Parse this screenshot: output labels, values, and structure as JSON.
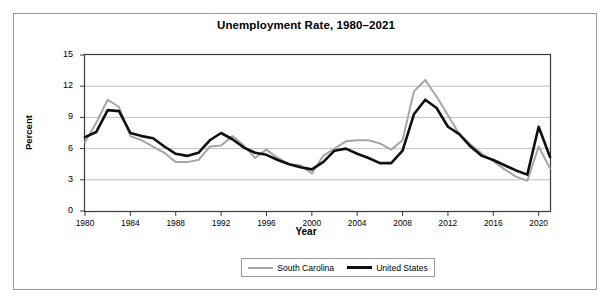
{
  "chart_data": {
    "type": "line",
    "title": "Unemployment Rate, 1980–2021",
    "xlabel": "Year",
    "ylabel": "Percent",
    "ylim": [
      0,
      15
    ],
    "xlim": [
      1980,
      2021
    ],
    "yticks": [
      0,
      3,
      6,
      9,
      12,
      15
    ],
    "xticks": [
      1980,
      1984,
      1988,
      1992,
      1996,
      2000,
      2004,
      2008,
      2012,
      2016,
      2020
    ],
    "grid": "horizontal",
    "legend_position": "bottom-center",
    "x": [
      1980,
      1981,
      1982,
      1983,
      1984,
      1985,
      1986,
      1987,
      1988,
      1989,
      1990,
      1991,
      1992,
      1993,
      1994,
      1995,
      1996,
      1997,
      1998,
      1999,
      2000,
      2001,
      2002,
      2003,
      2004,
      2005,
      2006,
      2007,
      2008,
      2009,
      2010,
      2011,
      2012,
      2013,
      2014,
      2015,
      2016,
      2017,
      2018,
      2019,
      2020,
      2021
    ],
    "series": [
      {
        "name": "South Carolina",
        "color": "#a6a6a6",
        "values": [
          6.6,
          8.5,
          10.7,
          10.0,
          7.2,
          6.8,
          6.2,
          5.6,
          4.7,
          4.7,
          4.9,
          6.2,
          6.3,
          7.2,
          6.3,
          5.1,
          5.9,
          5.1,
          4.5,
          4.4,
          3.6,
          5.3,
          6.0,
          6.7,
          6.8,
          6.8,
          6.5,
          5.9,
          6.8,
          11.5,
          12.6,
          11.0,
          9.2,
          7.4,
          6.4,
          5.5,
          4.8,
          4.0,
          3.3,
          2.9,
          6.2,
          4.1
        ]
      },
      {
        "name": "United States",
        "color": "#101010",
        "values": [
          7.1,
          7.6,
          9.7,
          9.6,
          7.5,
          7.2,
          7.0,
          6.2,
          5.5,
          5.3,
          5.6,
          6.8,
          7.5,
          6.9,
          6.1,
          5.6,
          5.4,
          4.9,
          4.5,
          4.2,
          4.0,
          4.7,
          5.8,
          6.0,
          5.5,
          5.1,
          4.6,
          4.6,
          5.8,
          9.3,
          10.7,
          9.9,
          8.1,
          7.4,
          6.2,
          5.3,
          4.9,
          4.4,
          3.9,
          3.5,
          8.1,
          5.2
        ]
      }
    ]
  },
  "legend": {
    "entries": [
      {
        "label": "South Carolina"
      },
      {
        "label": "United States"
      }
    ]
  }
}
